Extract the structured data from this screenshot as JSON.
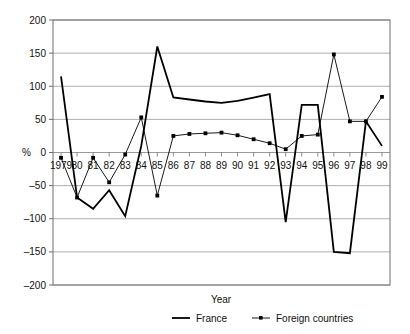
{
  "chart_data": {
    "type": "line",
    "title": "",
    "xlabel": "Year",
    "ylabel": "%",
    "ylim": [
      -200,
      200
    ],
    "yticks": [
      200,
      150,
      100,
      50,
      0,
      -50,
      -100,
      -150,
      -200
    ],
    "ytick_labels": [
      "200",
      "150",
      "100",
      "50",
      "0",
      "–50",
      "–100",
      "–150",
      "–200"
    ],
    "grid": true,
    "legend_position": "bottom",
    "categories": [
      "1979",
      "80",
      "81",
      "82",
      "83",
      "84",
      "85",
      "86",
      "87",
      "88",
      "89",
      "90",
      "91",
      "92",
      "93",
      "94",
      "95",
      "96",
      "97",
      "98",
      "99"
    ],
    "series": [
      {
        "name": "France",
        "marker": "none",
        "line_width": 1.8,
        "color": "#000000",
        "values": [
          115,
          -68,
          -85,
          -57,
          -96,
          10,
          160,
          83,
          80,
          77,
          75,
          78,
          83,
          88,
          -105,
          72,
          72,
          -150,
          -152,
          47,
          10
        ]
      },
      {
        "name": "Foreign countries",
        "marker": "square",
        "line_width": 0.9,
        "color": "#000000",
        "values": [
          -8,
          -68,
          -8,
          -45,
          -3,
          53,
          -65,
          25,
          28,
          29,
          30,
          26,
          20,
          14,
          5,
          25,
          27,
          148,
          47,
          47,
          84
        ]
      }
    ]
  },
  "legend": {
    "items": [
      {
        "label": "France",
        "marker": "line"
      },
      {
        "label": "Foreign countries",
        "marker": "line-square"
      }
    ]
  },
  "axes": {
    "x_title": "Year",
    "y_title": "%"
  },
  "colors": {
    "series": "#000000",
    "grid": "#9a9a9a",
    "frame": "#6f6f6f",
    "background": "#ffffff"
  }
}
